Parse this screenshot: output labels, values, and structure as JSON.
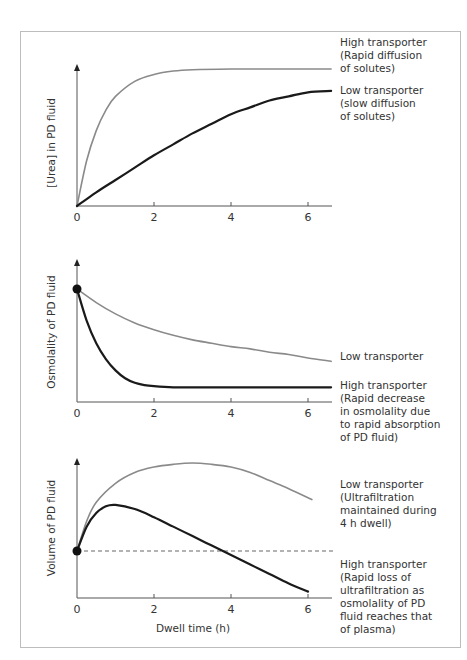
{
  "colors": {
    "high_curve_panel1": "#8a8a8a",
    "low_curve_panel1": "#1a1a1a",
    "grey_curve": "#8a8a8a",
    "black_curve": "#1a1a1a",
    "frame": "#bdbdbd",
    "text": "#333333"
  },
  "chart_data": [
    {
      "type": "line",
      "title": "",
      "xlabel": "",
      "ylabel": "[Urea] in PD fluid",
      "xticks": [
        "0",
        "2",
        "4",
        "6"
      ],
      "xlim": [
        0,
        6.6
      ],
      "ylim": [
        0,
        1
      ],
      "grid": false,
      "series": [
        {
          "name": "High transporter (Rapid diffusion of solutes)",
          "color": "grey",
          "x": [
            0,
            0.25,
            0.5,
            0.75,
            1,
            1.5,
            2,
            2.5,
            3,
            4,
            5,
            6.6
          ],
          "y": [
            0,
            0.33,
            0.55,
            0.7,
            0.8,
            0.91,
            0.96,
            0.985,
            0.995,
            1.0,
            1.0,
            1.0
          ]
        },
        {
          "name": "Low transporter (slow diffusion of solutes)",
          "color": "black",
          "x": [
            0,
            0.5,
            1,
            1.5,
            2,
            2.5,
            3,
            3.5,
            4,
            4.5,
            5,
            5.5,
            6,
            6.6
          ],
          "y": [
            0,
            0.1,
            0.19,
            0.28,
            0.37,
            0.45,
            0.53,
            0.6,
            0.67,
            0.72,
            0.77,
            0.8,
            0.83,
            0.84
          ]
        }
      ],
      "annotations": [
        {
          "lines": [
            "High transporter",
            "(Rapid diffusion",
            "of solutes)"
          ]
        },
        {
          "lines": [
            "Low transporter",
            "(slow diffusion",
            "of solutes)"
          ]
        }
      ]
    },
    {
      "type": "line",
      "title": "",
      "xlabel": "",
      "ylabel": "Osmolality of PD fluid",
      "xticks": [
        "0",
        "2",
        "4",
        "6"
      ],
      "xlim": [
        0,
        6.6
      ],
      "ylim": [
        0,
        1
      ],
      "grid": false,
      "start_marker": {
        "x": 0,
        "y": 1.0
      },
      "series": [
        {
          "name": "Low transporter",
          "color": "grey",
          "x": [
            0,
            0.5,
            1,
            1.5,
            2,
            2.5,
            3,
            3.5,
            4,
            4.5,
            5,
            5.5,
            6,
            6.6
          ],
          "y": [
            1.0,
            0.88,
            0.78,
            0.7,
            0.64,
            0.59,
            0.55,
            0.52,
            0.49,
            0.47,
            0.44,
            0.42,
            0.39,
            0.36
          ]
        },
        {
          "name": "High transporter (Rapid decrease in osmolality due to rapid absorption of PD fluid)",
          "color": "black",
          "x": [
            0,
            0.25,
            0.5,
            0.75,
            1,
            1.25,
            1.5,
            1.75,
            2,
            2.5,
            3,
            4,
            5,
            6,
            6.6
          ],
          "y": [
            1.0,
            0.72,
            0.52,
            0.38,
            0.28,
            0.21,
            0.17,
            0.15,
            0.14,
            0.13,
            0.13,
            0.13,
            0.13,
            0.13,
            0.13
          ]
        }
      ],
      "annotations": [
        {
          "lines": [
            "Low transporter"
          ]
        },
        {
          "lines": [
            "High transporter",
            "(Rapid decrease",
            "in osmolality due",
            "to rapid absorption",
            "of PD fluid)"
          ]
        }
      ]
    },
    {
      "type": "line",
      "title": "",
      "xlabel": "Dwell time (h)",
      "ylabel": "Volume of PD fluid",
      "xticks": [
        "0",
        "2",
        "4",
        "6"
      ],
      "xlim": [
        0,
        6.6
      ],
      "ylim": [
        0,
        1
      ],
      "grid": false,
      "start_marker": {
        "x": 0,
        "y": 0.34
      },
      "reference_line": {
        "style": "dashed",
        "y": 0.34,
        "meaning": "initial fill volume"
      },
      "series": [
        {
          "name": "Low transporter (Ultrafiltration maintained during 4 h dwell)",
          "color": "grey",
          "x": [
            0,
            0.25,
            0.5,
            1,
            1.5,
            2,
            2.5,
            3,
            3.5,
            4,
            4.5,
            5,
            5.5,
            6.1
          ],
          "y": [
            0.34,
            0.56,
            0.7,
            0.84,
            0.92,
            0.96,
            0.98,
            0.99,
            0.98,
            0.96,
            0.92,
            0.86,
            0.8,
            0.72
          ]
        },
        {
          "name": "High transporter (Rapid loss of ultrafiltration as osmolality of PD fluid reaches that of plasma)",
          "color": "black",
          "x": [
            0,
            0.25,
            0.5,
            0.75,
            1,
            1.5,
            2,
            2.5,
            3,
            3.5,
            4,
            4.5,
            5,
            5.5,
            6
          ],
          "y": [
            0.34,
            0.52,
            0.62,
            0.67,
            0.68,
            0.65,
            0.59,
            0.52,
            0.45,
            0.38,
            0.31,
            0.24,
            0.17,
            0.1,
            0.04
          ]
        }
      ],
      "annotations": [
        {
          "lines": [
            "Low transporter",
            "(Ultrafiltration",
            "maintained during",
            "4 h dwell)"
          ]
        },
        {
          "lines": [
            "High transporter",
            "(Rapid loss of",
            "ultrafiltration as",
            "osmolality of PD",
            "fluid reaches that",
            "of plasma)"
          ]
        }
      ]
    }
  ]
}
